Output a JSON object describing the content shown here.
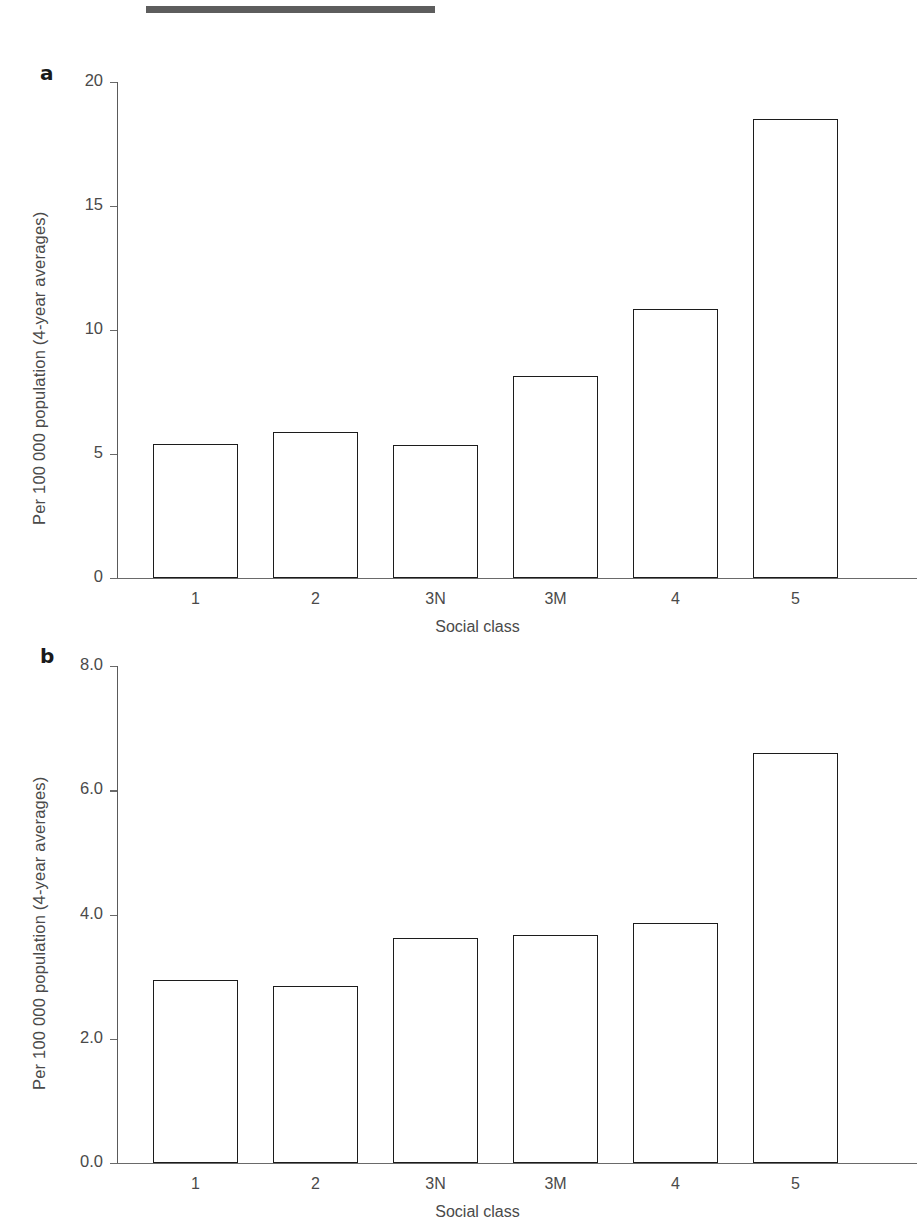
{
  "figure": {
    "top_rule": "horizontal-rule",
    "panels": [
      {
        "letter": "a",
        "ylabel": "Per 100 000 population (4-year averages)",
        "xlabel": "Social class"
      },
      {
        "letter": "b",
        "ylabel": "Per 100 000 population (4-year averages)",
        "xlabel": "Social class"
      }
    ]
  },
  "chart_data": [
    {
      "type": "bar",
      "panel": "a",
      "title": "",
      "categories": [
        "1",
        "2",
        "3N",
        "3M",
        "4",
        "5"
      ],
      "values": [
        5.4,
        5.9,
        5.35,
        8.15,
        10.85,
        18.5
      ],
      "xlabel": "Social class",
      "ylabel": "Per 100 000 population (4-year averages)",
      "ylim": [
        0,
        20
      ],
      "yticks": [
        0,
        5,
        10,
        15,
        20
      ],
      "ytick_labels": [
        "0",
        "5",
        "10",
        "15",
        "20"
      ],
      "grid": false,
      "legend": false,
      "bar_fill": "#ffffff",
      "bar_edge": "#1c1c1c"
    },
    {
      "type": "bar",
      "panel": "b",
      "title": "",
      "categories": [
        "1",
        "2",
        "3N",
        "3M",
        "4",
        "5"
      ],
      "values": [
        2.95,
        2.85,
        3.62,
        3.67,
        3.87,
        6.6
      ],
      "xlabel": "Social class",
      "ylabel": "Per 100 000 population (4-year averages)",
      "ylim": [
        0,
        8
      ],
      "yticks": [
        0,
        2,
        4,
        6,
        8
      ],
      "ytick_labels": [
        "0.0",
        "2.0",
        "4.0",
        "6.0",
        "8.0"
      ],
      "grid": false,
      "legend": false,
      "bar_fill": "#ffffff",
      "bar_edge": "#1c1c1c"
    }
  ]
}
